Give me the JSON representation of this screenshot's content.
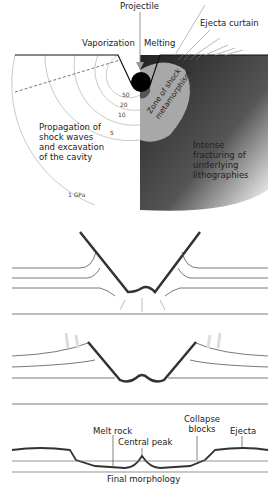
{
  "panel1": {
    "labels": {
      "projectile": "Projectile",
      "vaporization": "Vaporization",
      "melting": "Melting",
      "ejecta_curtain": "Ejecta curtain",
      "zone_line1": "Zone of shock",
      "zone_line2": "metamorphism",
      "propagation": "Propagation of shock waves and excavation of the cavity",
      "intense": "Intense fracturing of underlying lithographies"
    },
    "pressure_contours": [
      "50",
      "20",
      "10",
      "5",
      "1 GPa"
    ],
    "colors": {
      "projectile": "#000000",
      "zone": "#a8a8a8",
      "fracture_dark": "#3a3a3a",
      "contours": "#b0b0b0"
    }
  },
  "panel4": {
    "labels": {
      "melt_rock": "Melt rock",
      "central_peak": "Central peak",
      "collapse_blocks": "Collapse blocks",
      "ejecta": "Ejecta",
      "final_morphology": "Final morphology"
    }
  }
}
